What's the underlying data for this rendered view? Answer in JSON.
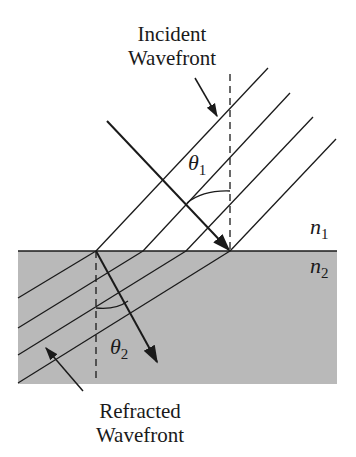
{
  "diagram": {
    "type": "refraction-wavefront",
    "labels": {
      "incident_line1": "Incident",
      "incident_line2": "Wavefront",
      "refracted_line1": "Refracted",
      "refracted_line2": "Wavefront",
      "theta1_symbol": "θ",
      "theta1_sub": "1",
      "theta2_symbol": "θ",
      "theta2_sub": "2",
      "n1_symbol": "n",
      "n1_sub": "1",
      "n2_symbol": "n",
      "n2_sub": "2"
    },
    "colors": {
      "ink": "#1a1a1a",
      "medium2_fill": "#b9b9b9",
      "background": "#ffffff"
    }
  }
}
